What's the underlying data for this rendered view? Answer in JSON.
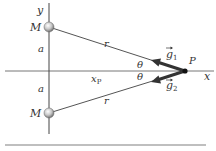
{
  "diagram": {
    "axes": {
      "x_label": "x",
      "y_label": "y"
    },
    "masses": [
      {
        "label": "M",
        "position": "top"
      },
      {
        "label": "M",
        "position": "bottom"
      }
    ],
    "point": {
      "label": "P"
    },
    "distances": {
      "r_top": "r",
      "r_bottom": "r",
      "a_top": "a",
      "a_bottom": "a",
      "xp_main": "x",
      "xp_sub": "P"
    },
    "angles": {
      "theta_top": "θ",
      "theta_bottom": "θ"
    },
    "vectors": [
      {
        "symbol": "g",
        "subscript": "1"
      },
      {
        "symbol": "g",
        "subscript": "2"
      }
    ],
    "colors": {
      "line": "#555555",
      "vector": "#333333",
      "mass_fill": "#bbbbbb",
      "rule": "#aaaaaa"
    }
  }
}
